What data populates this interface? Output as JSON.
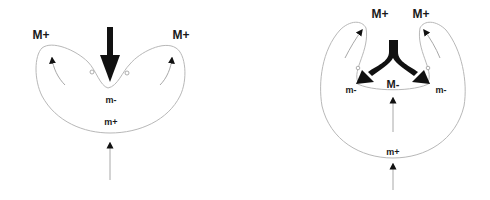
{
  "diagrams": [
    {
      "id": "left",
      "labels": {
        "top_left": "M+",
        "top_right": "M+",
        "center": "m-",
        "bottom": "m+"
      }
    },
    {
      "id": "right",
      "labels": {
        "top_left": "M+",
        "top_right": "M+",
        "center": "M-",
        "left": "m-",
        "right": "m-",
        "bottom": "m+"
      }
    }
  ],
  "colors": {
    "outline": "#b8b8b8",
    "thin_arrow": "#a8a8a8",
    "thick_arrow": "#111111",
    "text": "#1a1a1a"
  }
}
